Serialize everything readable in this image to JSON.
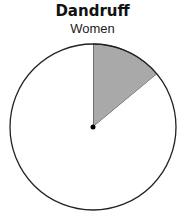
{
  "chart_data": {
    "type": "pie",
    "title": "Dandruff",
    "subtitle": "Women",
    "slices": [
      {
        "label": "Dandruff",
        "value": 14,
        "color": "#a9a9a9"
      },
      {
        "label": "No dandruff",
        "value": 86,
        "color": "#ffffff"
      }
    ],
    "start_angle_deg": 0,
    "direction": "clockwise",
    "legend": "none"
  }
}
